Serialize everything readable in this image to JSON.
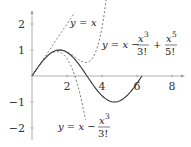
{
  "chart_data": {
    "type": "line",
    "title": "",
    "xlabel": "",
    "ylabel": "",
    "xlim": [
      0,
      8.7
    ],
    "ylim": [
      -2.4,
      2.5
    ],
    "grid": false,
    "x_ticks": [
      "2",
      "4",
      "6",
      "8"
    ],
    "y_ticks": [
      "2",
      "1",
      "-1",
      "-2"
    ],
    "series": [
      {
        "name": "sin x",
        "style": "solid",
        "x_range": [
          0,
          6.283
        ],
        "formula": "sin(x)"
      },
      {
        "name": "y = x",
        "style": "dashed",
        "x_range": [
          0,
          2.4
        ],
        "formula": "x"
      },
      {
        "name": "y = x - x^3/3!",
        "style": "dashed",
        "x_range": [
          0,
          3.05
        ],
        "formula": "x - x^3/6"
      },
      {
        "name": "y = x - x^3/3! + x^5/5!",
        "style": "dashed",
        "x_range": [
          0,
          4.25
        ],
        "formula": "x - x^3/6 + x^5/120"
      }
    ],
    "annotations": [
      {
        "text": "y = x",
        "near": [
          3.0,
          2.1
        ]
      },
      {
        "text": "y = x − x³/3! + x⁵/5!",
        "near": [
          5.5,
          0.9
        ]
      },
      {
        "text": "y = x − x³/3!",
        "near": [
          4.5,
          -2.0
        ]
      }
    ]
  },
  "ticks": {
    "x": [
      "2",
      "4",
      "6",
      "8"
    ],
    "y": [
      "2",
      "1",
      "−1",
      "−2"
    ]
  },
  "labels": {
    "linear": {
      "y": "y",
      "eq": "=",
      "x": "x"
    },
    "fifth": {
      "lhs": "y = x −",
      "n1": "x",
      "p1": "3",
      "d1": "3!",
      "plus": "+",
      "n2": "x",
      "p2": "5",
      "d2": "5!"
    },
    "third": {
      "lhs": "y = x −",
      "n1": "x",
      "p1": "3",
      "d1": "3!"
    }
  }
}
